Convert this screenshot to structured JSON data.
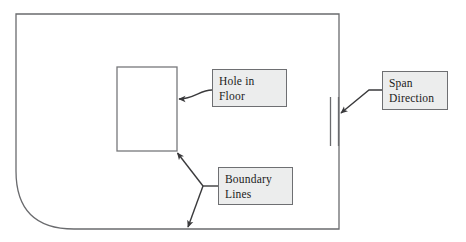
{
  "diagram": {
    "type": "architectural-floor-plan-annotation",
    "colors": {
      "background": "#ffffff",
      "outline_stroke": "#6a6b6e",
      "hole_stroke": "#77787b",
      "leader_stroke": "#3a3a3c",
      "callout_fill": "#eceded",
      "callout_border": "#6e6f72",
      "text": "#1b1b1b"
    },
    "shapes": {
      "floor_slab": {
        "name": "floor-outline",
        "description": "Floor slab outline with rounded bottom-left corner",
        "top": 14,
        "left": 16,
        "right": 339,
        "bottom": 229,
        "corner_radius": 58,
        "rounded_corner": "bottom-left"
      },
      "floor_opening": {
        "name": "hole-in-floor-rectangle",
        "left": 117,
        "top": 67,
        "right": 177,
        "bottom": 151
      },
      "span_direction_marker": {
        "name": "span-direction-tick-marks",
        "line_count": 2,
        "x_positions": [
          330,
          338
        ],
        "top": 97,
        "bottom": 146
      }
    },
    "callouts": [
      {
        "id": "hole-in-floor",
        "lines": [
          "Hole in",
          "Floor"
        ],
        "line1": "Hole in",
        "line2": "Floor",
        "leader": "curved arrow pointing left to right edge of floor opening"
      },
      {
        "id": "boundary-lines",
        "lines": [
          "Boundary",
          "Lines"
        ],
        "line1": "Boundary",
        "line2": "Lines",
        "leader": "two straight arrows from a shared junction, one to the opening corner, one to the slab bottom edge"
      },
      {
        "id": "span-direction",
        "lines": [
          "Span",
          "Direction"
        ],
        "line1": "Span",
        "line2": "Direction",
        "leader": "straight arrow pointing down-left to the span tick marks"
      }
    ]
  }
}
